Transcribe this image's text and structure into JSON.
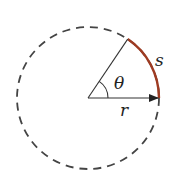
{
  "diagram": {
    "labels": {
      "angle": "θ",
      "arc": "s",
      "radius": "r"
    },
    "geometry": {
      "center": [
        88,
        98
      ],
      "radius": 71,
      "angle_deg": 56
    },
    "colors": {
      "circle": "#444444",
      "radius_lines": "#333333",
      "arc": "#9e3b22",
      "background": "#ffffff"
    }
  }
}
